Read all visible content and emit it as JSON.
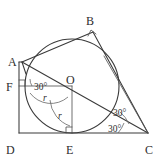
{
  "figure": {
    "type": "geometry-diagram",
    "background_color": "#ffffff",
    "line_color": "#3a3a3a"
  },
  "points": [
    {
      "name": "A",
      "label": "A",
      "x": 22,
      "y": 62,
      "label_x": 8,
      "label_y": 62
    },
    {
      "name": "B",
      "label": "B",
      "x": 93,
      "y": 32,
      "label_x": 88,
      "label_y": 21
    },
    {
      "name": "C",
      "label": "C",
      "x": 148,
      "y": 133,
      "label_x": 148,
      "label_y": 152
    },
    {
      "name": "D",
      "label": "D",
      "x": 19,
      "y": 133,
      "label_x": 8,
      "label_y": 152
    },
    {
      "name": "E",
      "label": "E",
      "x": 72,
      "y": 133,
      "label_x": 68,
      "label_y": 152
    },
    {
      "name": "F",
      "label": "F",
      "x": 19,
      "y": 86,
      "label_x": 8,
      "label_y": 90
    },
    {
      "name": "O",
      "label": "O",
      "x": 72,
      "y": 86,
      "label_x": 68,
      "label_y": 84
    }
  ],
  "circle": {
    "center_label": "O",
    "cx": 72,
    "cy": 86,
    "r": 47
  },
  "angles": [
    {
      "name": "angle-at-F-30",
      "value": "30°",
      "x": 40,
      "y": 88
    },
    {
      "name": "angle-at-C-upper-30",
      "value": "30°",
      "x": 117,
      "y": 113
    },
    {
      "name": "angle-at-C-lower-30",
      "value": "30°",
      "x": 112,
      "y": 129
    }
  ],
  "radii": [
    {
      "name": "radius-horizontal",
      "label": "r",
      "x": 45,
      "y": 99
    },
    {
      "name": "radius-vertical",
      "label": "r",
      "x": 60,
      "y": 117
    }
  ],
  "right_angle_markers": [
    {
      "name": "right-angle-at-B",
      "x": 90,
      "y": 34
    },
    {
      "name": "right-angle-at-F",
      "x": 21,
      "y": 84
    },
    {
      "name": "right-angle-at-E",
      "x": 70,
      "y": 131
    }
  ]
}
